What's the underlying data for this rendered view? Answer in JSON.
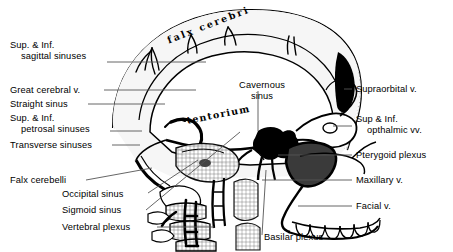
{
  "figure": {
    "type": "anatomical-line-diagram",
    "background_color": "#ffffff",
    "ink_color": "#000000"
  },
  "labels_left": [
    {
      "name": "sup-inf-sagittal-sinuses",
      "line1": "Sup. & Inf.",
      "line2": "sagittal sinuses"
    },
    {
      "name": "great-cerebral-v",
      "line1": "Great cerebral v.",
      "line2": ""
    },
    {
      "name": "straight-sinus",
      "line1": "Straight sinus",
      "line2": ""
    },
    {
      "name": "sup-inf-petrosal-sinuses",
      "line1": "Sup. & Inf.",
      "line2": "petrosal sinuses"
    },
    {
      "name": "transverse-sinuses",
      "line1": "Transverse sinuses",
      "line2": ""
    },
    {
      "name": "falx-cerebelli",
      "line1": "Falx cerebelli",
      "line2": ""
    },
    {
      "name": "occipital-sinus",
      "line1": "Occipital sinus",
      "line2": ""
    },
    {
      "name": "sigmoid-sinus",
      "line1": "Sigmoid sinus",
      "line2": ""
    },
    {
      "name": "vertebral-plexus",
      "line1": "Vertebral plexus",
      "line2": ""
    }
  ],
  "labels_right": [
    {
      "name": "supraorbital-v",
      "line1": "Supraorbital v.",
      "line2": ""
    },
    {
      "name": "sup-inf-opthalmic-vv",
      "line1": "Sup & Inf.",
      "line2": "opthalmic vv."
    },
    {
      "name": "pterygoid-plexus",
      "line1": "Pterygoid plexus",
      "line2": ""
    },
    {
      "name": "maxillary-v",
      "line1": "Maxillary v.",
      "line2": ""
    },
    {
      "name": "facial-v",
      "line1": "Facial v.",
      "line2": ""
    }
  ],
  "labels_inner": [
    {
      "name": "falx-cerebri",
      "text": "falx  cerebri",
      "style": "script"
    },
    {
      "name": "cavernous-sinus",
      "line1": "Cavernous",
      "line2": "sinus",
      "style": "plain"
    },
    {
      "name": "tentorium",
      "text": "tentorium",
      "style": "script"
    }
  ],
  "labels_bottom": [
    {
      "name": "basilar-plexus",
      "line1": "Basilar plexus",
      "line2": ""
    }
  ]
}
